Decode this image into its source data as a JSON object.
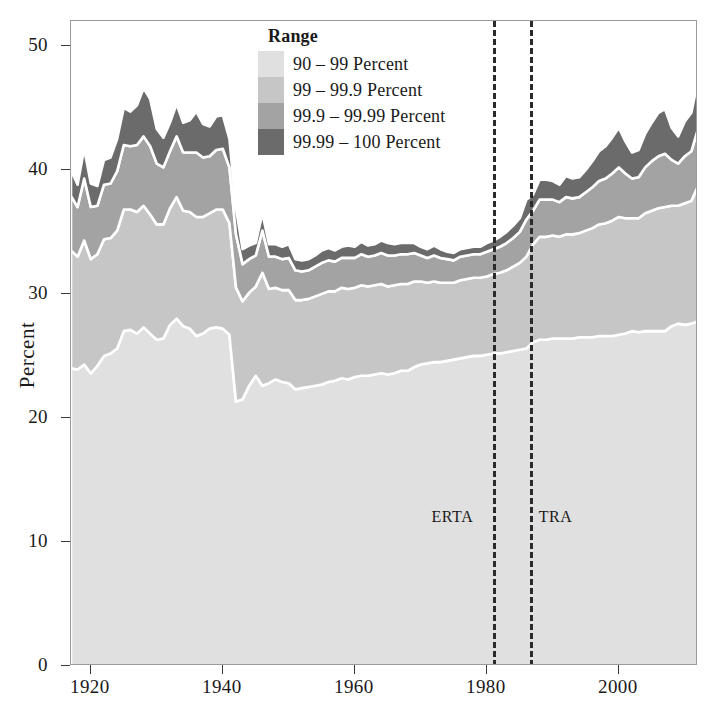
{
  "chart_data": {
    "type": "area",
    "title": "",
    "xlabel": "",
    "ylabel": "Percent",
    "xlim": [
      1917,
      2012
    ],
    "ylim": [
      0,
      52
    ],
    "grid": false,
    "stacked": true,
    "legend": {
      "position": "top-center",
      "title": "Range",
      "entries": [
        {
          "label": "90 – 99 Percent",
          "color": "#e0e0e0"
        },
        {
          "label": "99 – 99.9 Percent",
          "color": "#c6c6c6"
        },
        {
          "label": "99.9 – 99.99  Percent",
          "color": "#a3a3a3"
        },
        {
          "label": "99.99 – 100  Percent",
          "color": "#6b6b6b"
        }
      ]
    },
    "yticks": [
      0,
      10,
      20,
      30,
      40,
      50
    ],
    "ytick_labels": [
      "0",
      "10",
      "20",
      "30",
      "40",
      "50"
    ],
    "xticks": [
      1920,
      1940,
      1960,
      1980,
      2000
    ],
    "xtick_labels": [
      "1920",
      "1940",
      "1960",
      "1980",
      "2000"
    ],
    "annotations": [
      {
        "label": "ERTA",
        "x": 1981.0,
        "y": 12.0,
        "style": "dashed-vline",
        "label_side": "left"
      },
      {
        "label": "TRA",
        "x": 1986.5,
        "y": 12.0,
        "style": "dashed-vline",
        "label_side": "right"
      }
    ],
    "x": [
      1917,
      1918,
      1919,
      1920,
      1921,
      1922,
      1923,
      1924,
      1925,
      1926,
      1927,
      1928,
      1929,
      1930,
      1931,
      1932,
      1933,
      1934,
      1935,
      1936,
      1937,
      1938,
      1939,
      1940,
      1941,
      1942,
      1943,
      1944,
      1945,
      1946,
      1947,
      1948,
      1949,
      1950,
      1951,
      1952,
      1953,
      1954,
      1955,
      1956,
      1957,
      1958,
      1959,
      1960,
      1961,
      1962,
      1963,
      1964,
      1965,
      1966,
      1967,
      1968,
      1969,
      1970,
      1971,
      1972,
      1973,
      1974,
      1975,
      1976,
      1977,
      1978,
      1979,
      1980,
      1981,
      1982,
      1983,
      1984,
      1985,
      1986,
      1987,
      1988,
      1989,
      1990,
      1991,
      1992,
      1993,
      1994,
      1995,
      1996,
      1997,
      1998,
      1999,
      2000,
      2001,
      2002,
      2003,
      2004,
      2005,
      2006,
      2007,
      2008,
      2009,
      2010,
      2011,
      2012
    ],
    "series": [
      {
        "name": "90 – 99 Percent",
        "color": "#e0e0e0",
        "values": [
          24.0,
          23.9,
          24.3,
          23.6,
          24.2,
          25.0,
          25.2,
          25.6,
          27.0,
          27.1,
          26.8,
          27.3,
          26.8,
          26.3,
          26.4,
          27.5,
          28.0,
          27.4,
          27.2,
          26.6,
          26.8,
          27.2,
          27.3,
          27.2,
          26.7,
          21.3,
          21.5,
          22.6,
          23.4,
          22.6,
          22.8,
          23.1,
          22.9,
          22.8,
          22.3,
          22.4,
          22.5,
          22.6,
          22.7,
          22.9,
          23.0,
          23.2,
          23.1,
          23.3,
          23.4,
          23.4,
          23.5,
          23.6,
          23.5,
          23.6,
          23.8,
          23.8,
          24.1,
          24.3,
          24.4,
          24.5,
          24.5,
          24.6,
          24.7,
          24.8,
          24.9,
          25.0,
          25.0,
          25.1,
          25.2,
          25.2,
          25.3,
          25.4,
          25.5,
          25.6,
          26.1,
          26.3,
          26.3,
          26.4,
          26.4,
          26.4,
          26.4,
          26.5,
          26.5,
          26.5,
          26.6,
          26.6,
          26.6,
          26.7,
          26.8,
          27.0,
          26.9,
          27.0,
          27.0,
          27.0,
          27.0,
          27.4,
          27.6,
          27.5,
          27.6,
          27.8
        ]
      },
      {
        "name": "99 – 99.9 Percent",
        "color": "#c6c6c6",
        "values": [
          9.5,
          9.1,
          10.0,
          9.2,
          9.0,
          9.4,
          9.3,
          9.5,
          9.8,
          9.7,
          9.8,
          9.8,
          9.6,
          9.3,
          9.2,
          9.4,
          9.8,
          9.3,
          9.4,
          9.6,
          9.4,
          9.3,
          9.5,
          9.6,
          9.0,
          9.2,
          7.9,
          7.5,
          7.2,
          9.1,
          7.6,
          7.4,
          7.4,
          7.5,
          7.2,
          7.1,
          7.1,
          7.2,
          7.3,
          7.3,
          7.2,
          7.3,
          7.3,
          7.2,
          7.3,
          7.2,
          7.2,
          7.2,
          7.1,
          7.1,
          7.0,
          7.0,
          6.9,
          6.7,
          6.5,
          6.5,
          6.4,
          6.3,
          6.2,
          6.3,
          6.3,
          6.3,
          6.3,
          6.3,
          6.4,
          6.5,
          6.6,
          6.8,
          7.0,
          7.4,
          7.9,
          8.3,
          8.3,
          8.3,
          8.2,
          8.4,
          8.4,
          8.4,
          8.6,
          8.8,
          9.0,
          9.1,
          9.3,
          9.5,
          9.3,
          9.1,
          9.2,
          9.5,
          9.7,
          9.9,
          10.0,
          9.7,
          9.5,
          9.8,
          9.9,
          10.9
        ]
      },
      {
        "name": "99.9 – 99.99  Percent",
        "color": "#a3a3a3",
        "values": [
          4.4,
          4.0,
          5.0,
          4.2,
          3.9,
          4.4,
          4.4,
          4.8,
          5.2,
          5.1,
          5.4,
          5.6,
          5.5,
          4.9,
          4.6,
          4.6,
          4.9,
          4.7,
          4.8,
          5.2,
          4.8,
          4.6,
          4.8,
          4.9,
          4.5,
          4.3,
          3.0,
          2.7,
          2.5,
          3.4,
          2.6,
          2.5,
          2.5,
          2.6,
          2.4,
          2.3,
          2.3,
          2.4,
          2.5,
          2.5,
          2.4,
          2.4,
          2.5,
          2.4,
          2.5,
          2.4,
          2.4,
          2.5,
          2.5,
          2.4,
          2.4,
          2.4,
          2.3,
          2.1,
          2.0,
          2.1,
          2.0,
          1.9,
          1.8,
          1.9,
          1.9,
          1.9,
          1.9,
          2.0,
          2.0,
          2.1,
          2.2,
          2.3,
          2.5,
          3.0,
          2.7,
          3.0,
          3.0,
          2.9,
          2.8,
          3.0,
          2.9,
          2.9,
          3.1,
          3.3,
          3.5,
          3.6,
          3.8,
          4.0,
          3.6,
          3.2,
          3.3,
          3.7,
          4.0,
          4.2,
          4.3,
          3.7,
          3.4,
          3.8,
          4.0,
          4.6
        ]
      },
      {
        "name": "99.99 – 100  Percent",
        "color": "#6b6b6b",
        "values": [
          2.1,
          1.8,
          2.4,
          1.9,
          1.6,
          2.0,
          2.1,
          2.6,
          3.0,
          2.8,
          3.2,
          3.9,
          3.8,
          2.8,
          2.4,
          2.3,
          2.6,
          2.4,
          2.6,
          3.3,
          2.7,
          2.4,
          2.7,
          2.7,
          2.3,
          2.1,
          1.2,
          1.1,
          1.0,
          1.4,
          1.0,
          1.0,
          1.0,
          1.1,
          0.9,
          0.9,
          0.9,
          0.9,
          1.0,
          1.0,
          0.9,
          0.9,
          1.0,
          0.9,
          1.0,
          0.9,
          0.9,
          1.0,
          1.0,
          0.9,
          0.9,
          0.9,
          0.8,
          0.7,
          0.7,
          0.8,
          0.7,
          0.6,
          0.6,
          0.6,
          0.6,
          0.6,
          0.6,
          0.7,
          0.7,
          0.8,
          0.9,
          1.0,
          1.1,
          1.6,
          1.3,
          1.6,
          1.6,
          1.5,
          1.4,
          1.7,
          1.6,
          1.6,
          1.8,
          2.1,
          2.4,
          2.6,
          2.9,
          3.2,
          2.6,
          2.1,
          2.2,
          2.7,
          3.1,
          3.5,
          3.6,
          2.6,
          2.2,
          2.8,
          3.1,
          4.0
        ]
      }
    ]
  }
}
